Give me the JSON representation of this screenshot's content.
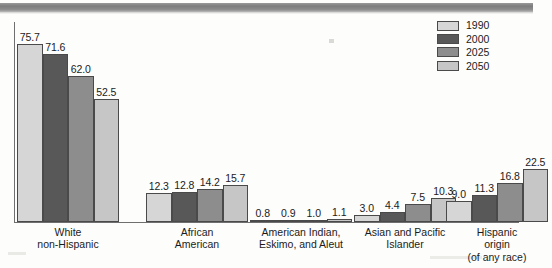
{
  "chart_data": {
    "type": "bar",
    "title": "",
    "subtitle": "",
    "xlabel": "",
    "ylabel": "",
    "ylim": [
      0,
      80
    ],
    "grid": false,
    "legend_position": "top-right",
    "value_label_format": "one-decimal",
    "categories": [
      "White\nnon-Hispanic",
      "African\nAmerican",
      "American Indian,\nEskimo, and Aleut",
      "Asian and Pacific\nIslander",
      "Hispanic\norigin\n(of any race)"
    ],
    "series": [
      {
        "name": "1990",
        "color": "#d6d6d6",
        "values": [
          75.7,
          12.3,
          0.8,
          3.0,
          9.0
        ]
      },
      {
        "name": "2000",
        "color": "#585858",
        "values": [
          71.6,
          12.8,
          0.9,
          4.4,
          11.3
        ]
      },
      {
        "name": "2025",
        "color": "#8d8d8d",
        "values": [
          62.0,
          14.2,
          1.0,
          7.5,
          16.8
        ]
      },
      {
        "name": "2050",
        "color": "#c6c6c6",
        "values": [
          52.5,
          15.7,
          1.1,
          10.3,
          22.5
        ]
      }
    ],
    "value_labels": [
      [
        "75.7",
        "71.6",
        "62.0",
        "52.5"
      ],
      [
        "12.3",
        "12.8",
        "14.2",
        "15.7"
      ],
      [
        "0.8",
        "0.9",
        "1.0",
        "1.1"
      ],
      [
        "3.0",
        "4.4",
        "7.5",
        "10.3"
      ],
      [
        "9.0",
        "11.3",
        "16.8",
        "22.5"
      ]
    ]
  },
  "legend": {
    "entries": [
      {
        "label": "1990",
        "color": "#d6d6d6"
      },
      {
        "label": "2000",
        "color": "#585858"
      },
      {
        "label": "2025",
        "color": "#8d8d8d"
      },
      {
        "label": "2050",
        "color": "#c6c6c6"
      }
    ]
  },
  "axes": {
    "y_axis_visible": true,
    "x_axis_visible": true,
    "tick_labels": []
  }
}
